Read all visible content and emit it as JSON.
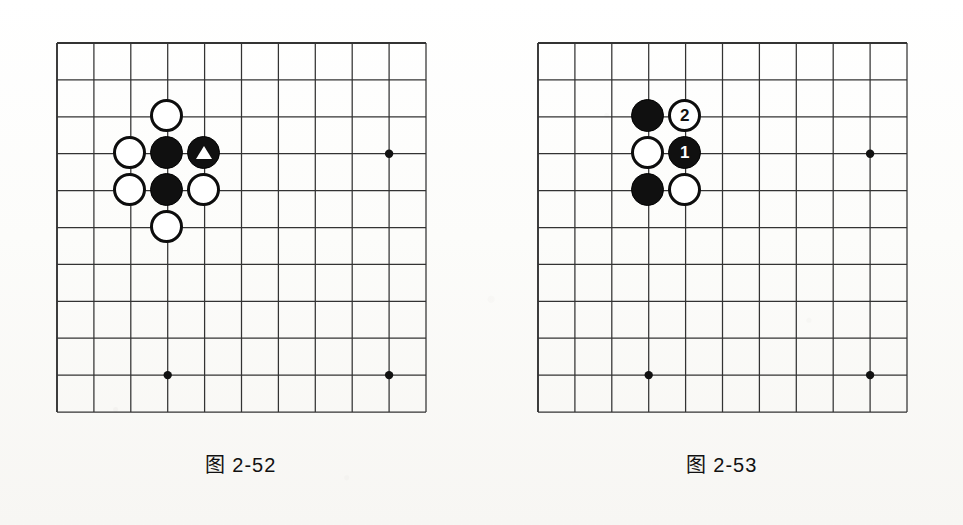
{
  "page": {
    "background_color": "#fbfbf9",
    "ink_color": "#111111",
    "width": 963,
    "height": 525
  },
  "figures": [
    {
      "id": "figure-2-52",
      "caption": "图 2-52",
      "board": {
        "origin_x": 56,
        "origin_y": 42,
        "cell": 36.9,
        "cols": 10,
        "rows": 10,
        "line_color": "#333333",
        "star_points": [
          {
            "col": 9,
            "row": 3
          },
          {
            "col": 3,
            "row": 9
          },
          {
            "col": 9,
            "row": 9
          }
        ],
        "stones": [
          {
            "col": 3,
            "row": 2,
            "color": "white",
            "marker": "",
            "label": ""
          },
          {
            "col": 2,
            "row": 3,
            "color": "white",
            "marker": "",
            "label": ""
          },
          {
            "col": 3,
            "row": 3,
            "color": "black",
            "marker": "",
            "label": ""
          },
          {
            "col": 4,
            "row": 3,
            "color": "black",
            "marker": "triangle",
            "label": ""
          },
          {
            "col": 2,
            "row": 4,
            "color": "white",
            "marker": "",
            "label": ""
          },
          {
            "col": 3,
            "row": 4,
            "color": "black",
            "marker": "",
            "label": ""
          },
          {
            "col": 4,
            "row": 4,
            "color": "white",
            "marker": "",
            "label": ""
          },
          {
            "col": 3,
            "row": 5,
            "color": "white",
            "marker": "",
            "label": ""
          }
        ]
      }
    },
    {
      "id": "figure-2-53",
      "caption": "图 2-53",
      "board": {
        "origin_x": 537,
        "origin_y": 42,
        "cell": 36.9,
        "cols": 10,
        "rows": 10,
        "line_color": "#333333",
        "star_points": [
          {
            "col": 9,
            "row": 3
          },
          {
            "col": 3,
            "row": 9
          },
          {
            "col": 9,
            "row": 9
          }
        ],
        "stones": [
          {
            "col": 3,
            "row": 2,
            "color": "black",
            "marker": "",
            "label": ""
          },
          {
            "col": 4,
            "row": 2,
            "color": "white",
            "marker": "number",
            "label": "2"
          },
          {
            "col": 3,
            "row": 3,
            "color": "white",
            "marker": "",
            "label": ""
          },
          {
            "col": 4,
            "row": 3,
            "color": "black",
            "marker": "number",
            "label": "1"
          },
          {
            "col": 3,
            "row": 4,
            "color": "black",
            "marker": "",
            "label": ""
          },
          {
            "col": 4,
            "row": 4,
            "color": "white",
            "marker": "",
            "label": ""
          }
        ]
      }
    }
  ]
}
